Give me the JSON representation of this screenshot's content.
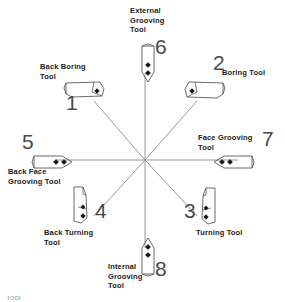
{
  "diagram": {
    "center": {
      "x": 145,
      "y": 160
    },
    "line_color": "#8c8c8c",
    "tool_outline_color": "#5a5a5a",
    "number_color": "#4a4a4a",
    "label_color": "#1a1a1a",
    "background_color": "#ffffff",
    "footer_artifact": "Tool"
  },
  "tools": [
    {
      "number": "1",
      "label": "Back Boring\nTool",
      "shape": "boring-bar-right-tip",
      "direction": "upper-left",
      "label_pos": {
        "x": 40,
        "y": 62
      },
      "label_width": 66,
      "label_align": "left",
      "number_pos": {
        "x": 66,
        "y": 92
      },
      "tool_pos": {
        "x": 64,
        "y": 80
      }
    },
    {
      "number": "2",
      "label": "Boring Tool",
      "shape": "boring-bar-left-tip",
      "direction": "upper-right",
      "label_pos": {
        "x": 222,
        "y": 68
      },
      "label_width": 60,
      "label_align": "left",
      "number_pos": {
        "x": 213,
        "y": 52
      },
      "tool_pos": {
        "x": 183,
        "y": 79
      }
    },
    {
      "number": "3",
      "label": "Turning Tool",
      "shape": "turning-right",
      "direction": "lower-right",
      "label_pos": {
        "x": 196,
        "y": 228
      },
      "label_width": 64,
      "label_align": "left",
      "number_pos": {
        "x": 184,
        "y": 200
      },
      "tool_pos": {
        "x": 200,
        "y": 186
      }
    },
    {
      "number": "4",
      "label": "Back Turning\nTool",
      "shape": "turning-left",
      "direction": "lower-left",
      "label_pos": {
        "x": 44,
        "y": 228
      },
      "label_width": 74,
      "label_align": "left",
      "number_pos": {
        "x": 95,
        "y": 200
      },
      "tool_pos": {
        "x": 70,
        "y": 185
      }
    },
    {
      "number": "5",
      "label": "Back Face\nGrooving Tool",
      "shape": "grooving-right-point",
      "direction": "left",
      "label_pos": {
        "x": 8,
        "y": 167
      },
      "label_width": 78,
      "label_align": "left",
      "number_pos": {
        "x": 22,
        "y": 131
      },
      "tool_pos": {
        "x": 32,
        "y": 152
      }
    },
    {
      "number": "6",
      "label": "External\nGrooving\nTool",
      "shape": "grooving-down-point",
      "direction": "up",
      "label_pos": {
        "x": 130,
        "y": 6
      },
      "label_width": 58,
      "label_align": "left",
      "number_pos": {
        "x": 155,
        "y": 36
      },
      "tool_pos": {
        "x": 138,
        "y": 44
      }
    },
    {
      "number": "7",
      "label": "Face Grooving\nTool",
      "shape": "grooving-left-point",
      "direction": "right",
      "label_pos": {
        "x": 198,
        "y": 133
      },
      "label_width": 76,
      "label_align": "left",
      "number_pos": {
        "x": 262,
        "y": 128
      },
      "tool_pos": {
        "x": 214,
        "y": 152
      }
    },
    {
      "number": "8",
      "label": "Internal\nGrooving\nTool",
      "shape": "grooving-up-point",
      "direction": "down",
      "label_pos": {
        "x": 108,
        "y": 262
      },
      "label_width": 54,
      "label_align": "left",
      "number_pos": {
        "x": 155,
        "y": 258
      },
      "tool_pos": {
        "x": 138,
        "y": 238
      }
    }
  ],
  "spokes": [
    {
      "name": "spoke-to-tool-1",
      "x2": 94,
      "y2": 101
    },
    {
      "name": "spoke-to-tool-2",
      "x2": 197,
      "y2": 101
    },
    {
      "name": "spoke-to-tool-3",
      "x2": 197,
      "y2": 216
    },
    {
      "name": "spoke-to-tool-4",
      "x2": 94,
      "y2": 216
    },
    {
      "name": "spoke-to-tool-5",
      "x2": 56,
      "y2": 160
    },
    {
      "name": "spoke-to-tool-6",
      "x2": 145,
      "y2": 73
    },
    {
      "name": "spoke-to-tool-7",
      "x2": 238,
      "y2": 160
    },
    {
      "name": "spoke-to-tool-8",
      "x2": 145,
      "y2": 248
    }
  ]
}
